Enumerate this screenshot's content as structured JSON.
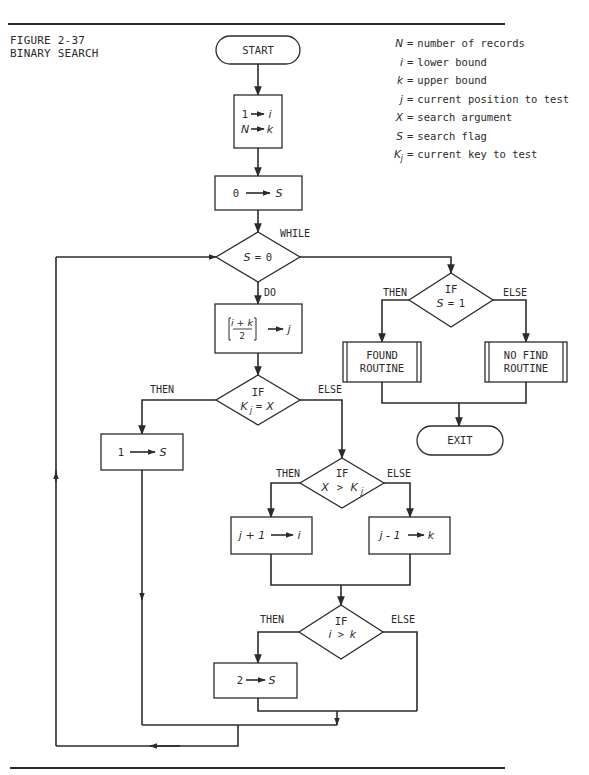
{
  "figure": {
    "number_label": "FIGURE 2-37",
    "title": "BINARY SEARCH"
  },
  "legend": [
    {
      "symbol": "N",
      "sub": "",
      "description": "number of records"
    },
    {
      "symbol": "i",
      "sub": "",
      "description": "lower bound"
    },
    {
      "symbol": "k",
      "sub": "",
      "description": "upper bound"
    },
    {
      "symbol": "j",
      "sub": "",
      "description": "current position to test"
    },
    {
      "symbol": "X",
      "sub": "",
      "description": "search argument"
    },
    {
      "symbol": "S",
      "sub": "",
      "description": "search flag"
    },
    {
      "symbol": "K",
      "sub": "j",
      "description": "current key to test"
    }
  ],
  "legend_equals": "=",
  "flowchart": {
    "start": "START",
    "init": {
      "line1_left": "1",
      "line1_right": "i",
      "line2_left": "N",
      "line2_right": "k"
    },
    "set_flag_zero": {
      "left": "0",
      "right": "S"
    },
    "while": {
      "keyword": "WHILE",
      "condition_left": "S",
      "condition_op": "=",
      "condition_right": "0",
      "do_label": "DO"
    },
    "midpoint": {
      "numerator": "i + k",
      "denominator": "2",
      "target": "j"
    },
    "if_found": {
      "keyword": "IF",
      "condition_left": "K",
      "condition_sub": "j",
      "condition_op": "=",
      "condition_right": "X",
      "then_label": "THEN",
      "else_label": "ELSE"
    },
    "set_flag_one": {
      "left": "1",
      "right": "S"
    },
    "if_greater": {
      "keyword": "IF",
      "condition_left": "X",
      "condition_op": ">",
      "condition_right": "K",
      "condition_sub": "j",
      "then_label": "THEN",
      "else_label": "ELSE"
    },
    "raise_lower": {
      "left": "j + 1",
      "right": "i"
    },
    "lower_upper": {
      "left": "j - 1",
      "right": "k"
    },
    "if_crossed": {
      "keyword": "IF",
      "condition_left": "i",
      "condition_op": ">",
      "condition_right": "k",
      "then_label": "THEN",
      "else_label": "ELSE"
    },
    "set_flag_two": {
      "left": "2",
      "right": "S"
    },
    "if_result": {
      "keyword": "IF",
      "condition_left": "S",
      "condition_op": "=",
      "condition_right": "1",
      "then_label": "THEN",
      "else_label": "ELSE"
    },
    "found_routine": {
      "line1": "FOUND",
      "line2": "ROUTINE"
    },
    "no_find_routine": {
      "line1": "NO FIND",
      "line2": "ROUTINE"
    },
    "exit": "EXIT"
  }
}
